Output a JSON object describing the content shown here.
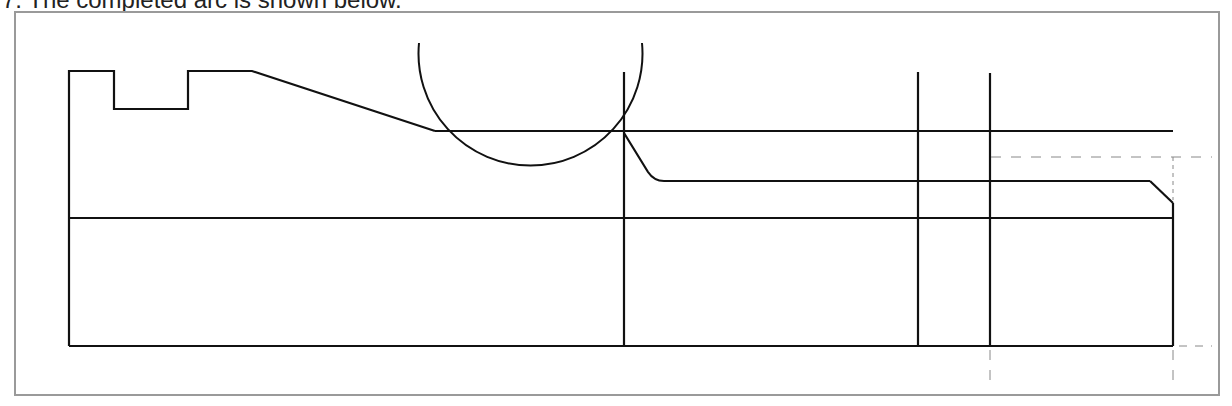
{
  "caption": {
    "text": "7.   The completed arc is shown below."
  },
  "drawing": {
    "type": "cad-profile",
    "line_color": "#111111",
    "construction_line_color": "#888888",
    "frame_color": "#9a9a9a",
    "elements": [
      "part-profile-outline",
      "arc-circle",
      "vertical-construction-lines",
      "horizontal-construction-lines",
      "dashed-reference-lines"
    ]
  }
}
